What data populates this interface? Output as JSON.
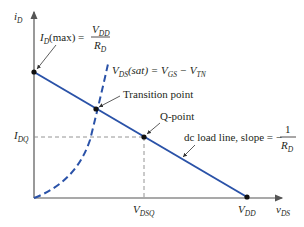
{
  "diagram": {
    "axes": {
      "y_label": {
        "main": "i",
        "sub": "D"
      },
      "x_label": {
        "main": "v",
        "sub": "DS"
      }
    },
    "annotations": {
      "id_max": {
        "lhs_main": "I",
        "lhs_sub": "D",
        "lhs_rest": "(max) = ",
        "num_main": "V",
        "num_sub": "DD",
        "den_main": "R",
        "den_sub": "D"
      },
      "vds_sat": {
        "p1": "V",
        "p1_sub": "DS",
        "p2": "(sat) = V",
        "p2_sub": "GS",
        "p3": " − V",
        "p3_sub": "TN"
      },
      "transition_point": "Transition point",
      "q_point": "Q-point",
      "load_line": {
        "text": "dc load line, slope = −",
        "num": "1",
        "den_main": "R",
        "den_sub": "D"
      },
      "idq": {
        "main": "I",
        "sub": "DQ"
      },
      "vdsq": {
        "main": "V",
        "sub": "DSQ"
      },
      "vdd": {
        "main": "V",
        "sub": "DD"
      }
    },
    "colors": {
      "load_line": "#2a52a8",
      "saturation_curve": "#2a52a8",
      "axes": "#555555",
      "text": "#231f20",
      "guides": "#888888"
    },
    "points": {
      "origin": [
        34,
        198
      ],
      "id_max": [
        34,
        72
      ],
      "transition": [
        96,
        109
      ],
      "q_point": [
        144,
        137
      ],
      "vdd": [
        247,
        197
      ]
    }
  }
}
